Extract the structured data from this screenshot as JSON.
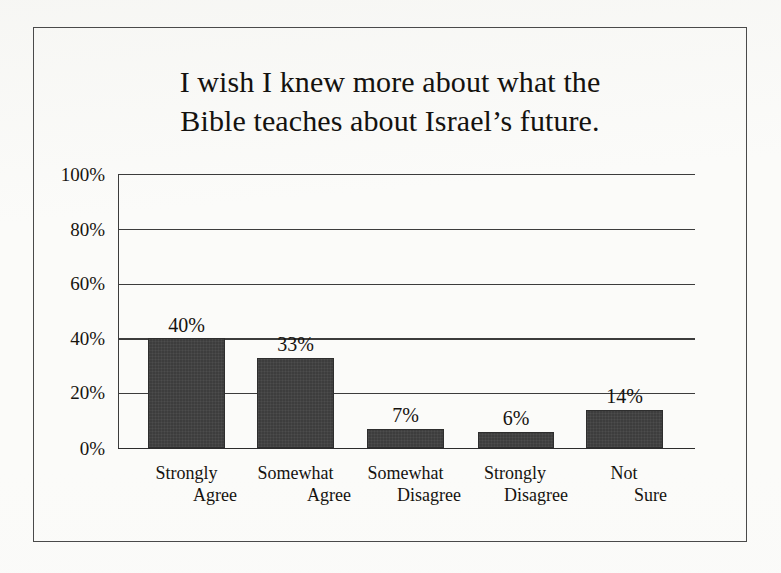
{
  "figure": {
    "background_color": "#fbfbf9",
    "frame_color": "#4a4a4a"
  },
  "chart_data": {
    "type": "bar",
    "title_lines": [
      "I wish I knew more about what the",
      "Bible teaches about Israel’s future."
    ],
    "xlabel": "",
    "ylabel": "",
    "ylim": [
      0,
      100
    ],
    "yticks": [
      0,
      20,
      40,
      60,
      80,
      100
    ],
    "ytick_labels": [
      "0%",
      "20%",
      "40%",
      "60%",
      "80%",
      "100%"
    ],
    "grid": true,
    "legend": false,
    "bar_color": "#3d3d3d",
    "categories": [
      "Strongly Agree",
      "Somewhat Agree",
      "Somewhat Disagree",
      "Strongly Disagree",
      "Not Sure"
    ],
    "category_lines": [
      [
        "Strongly",
        "Agree"
      ],
      [
        "Somewhat",
        "Agree"
      ],
      [
        "Somewhat",
        "Disagree"
      ],
      [
        "Strongly",
        "Disagree"
      ],
      [
        "Not",
        "Sure"
      ]
    ],
    "values": [
      40,
      33,
      7,
      6,
      14
    ],
    "value_labels": [
      "40%",
      "33%",
      "7%",
      "6%",
      "14%"
    ]
  }
}
